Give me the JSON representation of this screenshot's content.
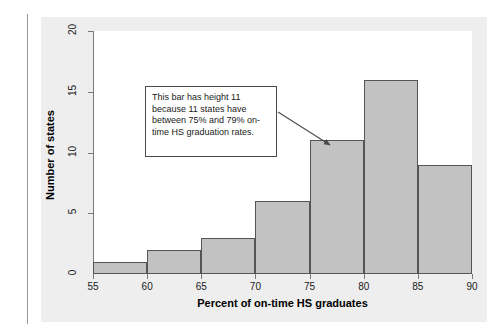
{
  "figure": {
    "annotation": {
      "text": "This bar has height 11 because 11 states have between 75% and 79% on-time HS graduation rates."
    },
    "colors": {
      "bar_fill": "#c2c2c2",
      "bar_stroke": "#555555",
      "panel_background": "#eeeeee",
      "plot_background": "#ffffff",
      "axis": "#7a7a7a"
    }
  },
  "chart_data": {
    "type": "bar",
    "title": "",
    "subtitle": "",
    "xlabel": "Percent of on-time HS graduates",
    "ylabel": "Number of states",
    "xlim": [
      55,
      90
    ],
    "ylim": [
      0,
      20
    ],
    "xticks": [
      55,
      60,
      65,
      70,
      75,
      80,
      85,
      90
    ],
    "yticks": [
      0,
      5,
      10,
      15,
      20
    ],
    "xtick_labels": [
      "55",
      "60",
      "65",
      "70",
      "75",
      "80",
      "85",
      "90"
    ],
    "ytick_labels": [
      "0",
      "5",
      "10",
      "15",
      "20"
    ],
    "grid": false,
    "legend": null,
    "bin_width": 5,
    "categories": [
      "55-59",
      "60-64",
      "65-69",
      "70-74",
      "75-79",
      "80-84",
      "85-89"
    ],
    "bin_edges": [
      55,
      60,
      65,
      70,
      75,
      80,
      85,
      90
    ],
    "values": [
      1,
      2,
      3,
      6,
      11,
      16,
      9
    ],
    "annotations": [
      {
        "text": "This bar has height 11 because 11 states have between 75% and 79% on-time HS graduation rates.",
        "points_to_bin": "75-79",
        "points_to_value": 11
      }
    ]
  }
}
